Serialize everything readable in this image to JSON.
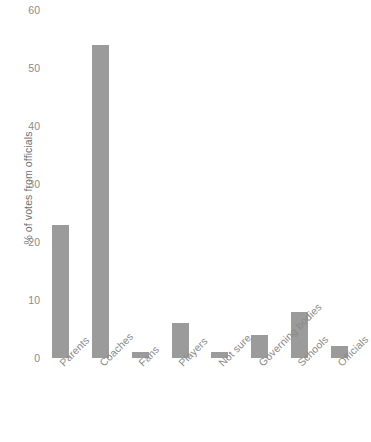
{
  "chart_data": {
    "type": "bar",
    "title": "",
    "xlabel": "",
    "ylabel": "% of votes from officials",
    "categories": [
      "Parents",
      "Coaches",
      "Fans",
      "Players",
      "Not sure",
      "Governing bodies",
      "Schools",
      "Officials"
    ],
    "values": [
      23,
      54,
      1,
      6,
      1,
      4,
      8,
      2
    ],
    "ylim": [
      0,
      60
    ],
    "yticks": [
      0,
      10,
      20,
      30,
      40,
      50,
      60
    ],
    "ytick_labels": [
      "0",
      "10",
      "20",
      "30",
      "40",
      "50",
      "60"
    ],
    "grid": false,
    "legend": "none",
    "bar_color": "#9b9b9b",
    "axis_text_color": "#8a8a8a"
  }
}
